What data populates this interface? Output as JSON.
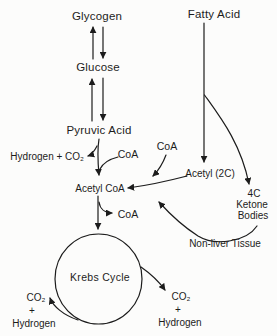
{
  "diagram": {
    "ink_color": "#1c1c1c",
    "background_color": "#fcfcfb",
    "nodes": {
      "glycogen": "Glycogen",
      "glucose": "Glucose",
      "pyruvic_acid": "Pyruvic Acid",
      "fatty_acid": "Fatty Acid",
      "hydrogen_co2_out": "Hydrogen + CO₂",
      "coa_in_pyruvate": "CoA",
      "coa_in_acetyl2c": "CoA",
      "acetyl_2c": "Acetyl (2C)",
      "acetyl_coa": "Acetyl CoA",
      "coa_released": "CoA",
      "ketone_4c": "4C",
      "ketone_word": "Ketone",
      "bodies_word": "Bodies",
      "non_liver_tissue": "Non-liver Tissue",
      "krebs_cycle": "Krebs Cycle",
      "left_co2": "CO₂",
      "left_plus": "+",
      "left_hydrogen": "Hydrogen",
      "right_co2": "CO₂",
      "right_plus": "+",
      "right_hydrogen": "Hydrogen"
    },
    "edges": [
      {
        "from": "Glycogen",
        "to": "Glucose",
        "reversible": true
      },
      {
        "from": "Glucose",
        "to": "Pyruvic Acid",
        "reversible": true
      },
      {
        "from": "Pyruvic Acid",
        "to": "Acetyl CoA",
        "inputs": [
          "CoA"
        ],
        "outputs": [
          "Hydrogen + CO₂"
        ]
      },
      {
        "from": "Fatty Acid",
        "to": "Acetyl (2C)"
      },
      {
        "from": "Fatty Acid",
        "to": "4C Ketone Bodies"
      },
      {
        "from": "Acetyl (2C)",
        "to": "Acetyl CoA",
        "inputs": [
          "CoA"
        ]
      },
      {
        "from": "4C Ketone Bodies",
        "to": "Acetyl CoA",
        "via": "Non-liver Tissue"
      },
      {
        "from": "Acetyl CoA",
        "to": "Krebs Cycle",
        "outputs": [
          "CoA"
        ]
      },
      {
        "from": "Krebs Cycle",
        "to": "CO₂ + Hydrogen",
        "side": "left"
      },
      {
        "from": "Krebs Cycle",
        "to": "CO₂ + Hydrogen",
        "side": "right"
      }
    ]
  }
}
